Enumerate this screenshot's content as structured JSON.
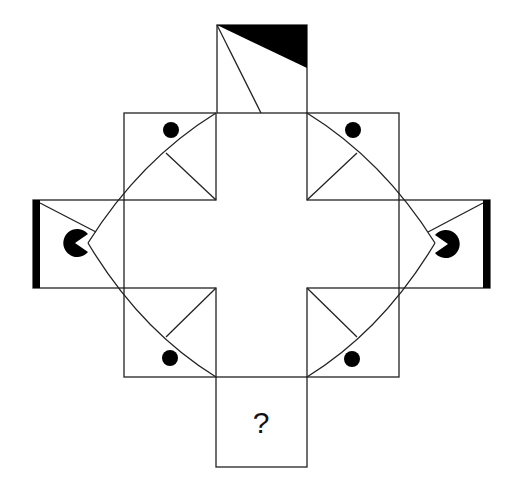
{
  "puzzle": {
    "type": "visual-reasoning-cross",
    "question_mark": "?",
    "colors": {
      "stroke": "#222222",
      "fill": "#000000",
      "background": "#ffffff"
    },
    "cells": [
      {
        "position": "top",
        "contents": [
          "black-triangle-top-right",
          "diagonal-line"
        ]
      },
      {
        "position": "upper-left",
        "contents": [
          "dot",
          "arc",
          "line"
        ]
      },
      {
        "position": "upper-right",
        "contents": [
          "dot",
          "arc",
          "line"
        ]
      },
      {
        "position": "left",
        "contents": [
          "black-bar-left",
          "pacman-facing-right",
          "line"
        ]
      },
      {
        "position": "right",
        "contents": [
          "black-bar-right",
          "pacman-facing-left",
          "line"
        ]
      },
      {
        "position": "lower-left",
        "contents": [
          "dot",
          "arc",
          "line"
        ]
      },
      {
        "position": "lower-right",
        "contents": [
          "dot",
          "arc",
          "line"
        ]
      },
      {
        "position": "bottom",
        "contents": [
          "question-mark"
        ]
      }
    ]
  }
}
